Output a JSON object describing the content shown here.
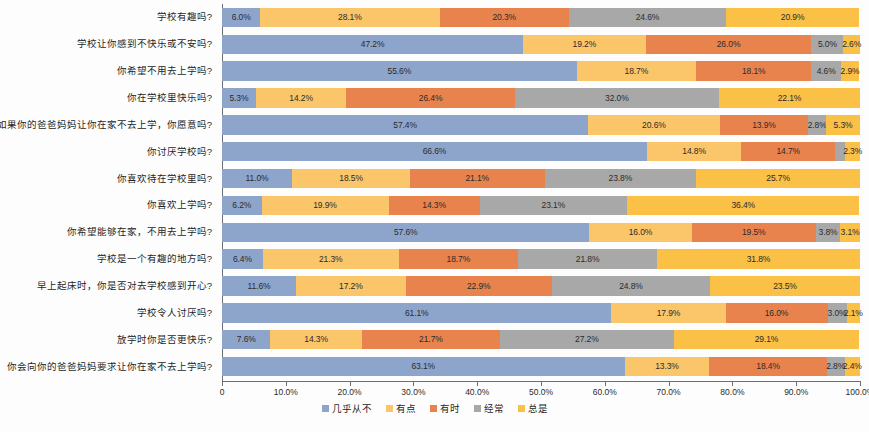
{
  "chart_data": {
    "type": "bar",
    "orientation": "horizontal",
    "stacked": true,
    "stack_total": 100,
    "title": "",
    "subtitle": "",
    "xlabel": "",
    "ylabel": "",
    "xlim": [
      0,
      100
    ],
    "grid": false,
    "legend_position": "bottom",
    "xtick_labels": [
      "0",
      "10.0%",
      "20.0%",
      "30.0%",
      "40.0%",
      "50.0%",
      "60.0%",
      "70.0%",
      "80.0%",
      "90.0%",
      "100.0%"
    ],
    "xtick_values": [
      0,
      10,
      20,
      30,
      40,
      50,
      60,
      70,
      80,
      90,
      100
    ],
    "categories": [
      "学校有趣吗?",
      "学校让你感到不快乐或不安吗?",
      "你希望不用去上学吗?",
      "你在学校里快乐吗?",
      "如果你的爸爸妈妈让你在家不去上学，你愿意吗?",
      "你讨厌学校吗?",
      "你喜欢待在学校里吗?",
      "你喜欢上学吗?",
      "你希望能够在家，不用去上学吗?",
      "学校是一个有趣的地方吗?",
      "早上起床时，你是否对去学校感到开心?",
      "学校令人讨厌吗?",
      "放学时你是否更快乐?",
      "你会向你的爸爸妈妈要求让你在家不去上学吗?"
    ],
    "series": [
      {
        "name": "几乎从不",
        "color": "#8EA5CB",
        "values": [
          6.0,
          47.2,
          55.6,
          5.3,
          57.4,
          66.6,
          11.0,
          6.2,
          57.6,
          6.4,
          11.6,
          61.1,
          7.6,
          63.1
        ],
        "labels": [
          "6.0%",
          "47.2%",
          "55.6%",
          "5.3%",
          "57.4%",
          "66.6%",
          "11.0%",
          "6.2%",
          "57.6%",
          "6.4%",
          "11.6%",
          "61.1%",
          "7.6%",
          "63.1%"
        ]
      },
      {
        "name": "有点",
        "color": "#FBC56A",
        "values": [
          28.1,
          19.2,
          18.7,
          14.2,
          20.6,
          14.8,
          18.5,
          19.9,
          16.0,
          21.3,
          17.2,
          17.9,
          14.3,
          13.3
        ],
        "labels": [
          "28.1%",
          "19.2%",
          "18.7%",
          "14.2%",
          "20.6%",
          "14.8%",
          "18.5%",
          "19.9%",
          "16.0%",
          "21.3%",
          "17.2%",
          "17.9%",
          "14.3%",
          "13.3%"
        ]
      },
      {
        "name": "有时",
        "color": "#E8834E",
        "values": [
          20.3,
          26.0,
          18.1,
          26.4,
          13.9,
          14.7,
          21.1,
          14.3,
          19.5,
          18.7,
          22.9,
          16.0,
          21.7,
          18.4
        ],
        "labels": [
          "20.3%",
          "26.0%",
          "18.1%",
          "26.4%",
          "13.9%",
          "14.7%",
          "21.1%",
          "14.3%",
          "19.5%",
          "18.7%",
          "22.9%",
          "16.0%",
          "21.7%",
          "18.4%"
        ]
      },
      {
        "name": "经常",
        "color": "#A8A8A8",
        "values": [
          24.6,
          5.0,
          4.6,
          32.0,
          2.8,
          1.6,
          23.8,
          23.1,
          3.8,
          21.8,
          24.8,
          3.0,
          27.2,
          2.8
        ],
        "labels": [
          "24.6%",
          "5.0%",
          "4.6%",
          "32.0%",
          "2.8%",
          "1.6%",
          "23.8%",
          "23.1%",
          "3.8%",
          "21.8%",
          "24.8%",
          "3.0%",
          "27.2%",
          "2.8%"
        ]
      },
      {
        "name": "总是",
        "color": "#FBC046",
        "values": [
          20.9,
          2.6,
          2.9,
          22.1,
          5.3,
          2.3,
          25.7,
          36.4,
          3.1,
          31.8,
          23.5,
          2.1,
          29.1,
          2.4
        ],
        "labels": [
          "20.9%",
          "2.6%",
          "2.9%",
          "22.1%",
          "5.3%",
          "2.3%",
          "25.7%",
          "36.4%",
          "3.1%",
          "31.8%",
          "23.5%",
          "2.1%",
          "29.1%",
          "2.4%"
        ]
      }
    ]
  }
}
